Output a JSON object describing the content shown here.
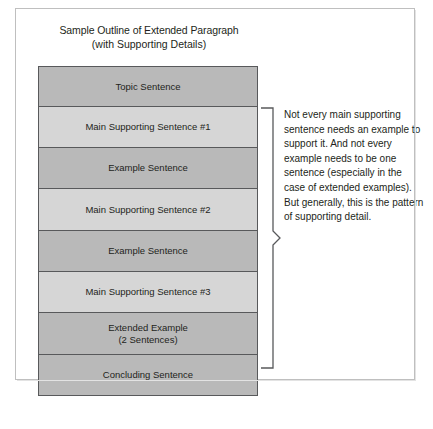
{
  "figure": {
    "title_line1": "Sample Outline of Extended Paragraph",
    "title_line2": "(with Supporting Details)",
    "colors": {
      "box_dark": "#b9b9b9",
      "box_light": "#d6d6d6",
      "box_border": "#58595b",
      "frame_border": "#bfbfbf",
      "text": "#231f20"
    }
  },
  "outline": {
    "boxes": [
      {
        "label": "Topic Sentence",
        "sublabel": "",
        "shade": "dark"
      },
      {
        "label": "Main Supporting Sentence #1",
        "sublabel": "",
        "shade": "light"
      },
      {
        "label": "Example Sentence",
        "sublabel": "",
        "shade": "dark"
      },
      {
        "label": "Main Supporting Sentence #2",
        "sublabel": "",
        "shade": "light"
      },
      {
        "label": "Example Sentence",
        "sublabel": "",
        "shade": "dark"
      },
      {
        "label": "Main Supporting Sentence #3",
        "sublabel": "",
        "shade": "light"
      },
      {
        "label": "Extended Example",
        "sublabel": "(2 Sentences)",
        "shade": "dark"
      },
      {
        "label": "Concluding Sentence",
        "sublabel": "",
        "shade": "dark"
      }
    ]
  },
  "annotation": {
    "bracket_icon": "curly-brace-icon",
    "text": "Not every main supporting sentence needs an example to support it. And not every example needs to be one sentence (especially in the case of extended examples). But generally, this is the pattern of supporting detail."
  }
}
